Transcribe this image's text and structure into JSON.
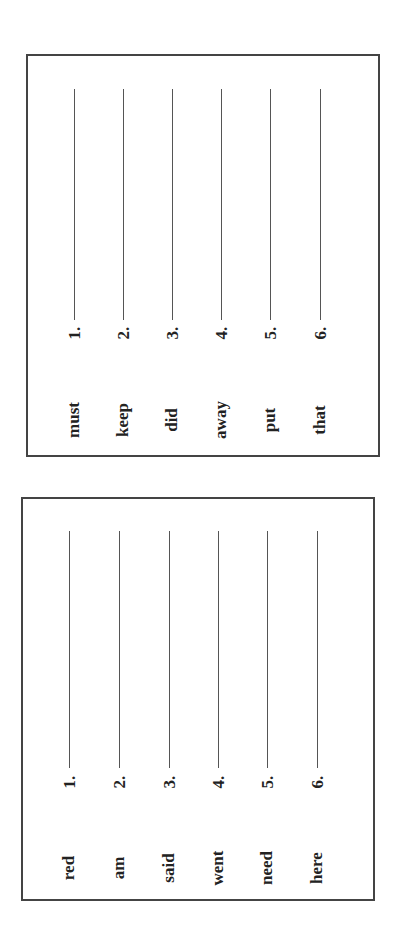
{
  "worksheets": [
    {
      "items": [
        {
          "number": "1.",
          "word": "must"
        },
        {
          "number": "2.",
          "word": "keep"
        },
        {
          "number": "3.",
          "word": "did"
        },
        {
          "number": "4.",
          "word": "away"
        },
        {
          "number": "5.",
          "word": "put"
        },
        {
          "number": "6.",
          "word": "that"
        }
      ]
    },
    {
      "items": [
        {
          "number": "1.",
          "word": "red"
        },
        {
          "number": "2.",
          "word": "am"
        },
        {
          "number": "3.",
          "word": "said"
        },
        {
          "number": "4.",
          "word": "went"
        },
        {
          "number": "5.",
          "word": "need"
        },
        {
          "number": "6.",
          "word": "here"
        }
      ]
    }
  ]
}
